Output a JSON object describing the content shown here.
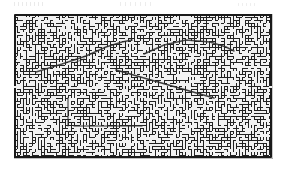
{
  "document": {
    "kind": "scanned-maze-puzzle",
    "page_background": "#ffffff",
    "title": ""
  },
  "figure": {
    "name": "maze",
    "caption": "",
    "x": 14,
    "y": 14,
    "width": 258,
    "height": 144,
    "border_color": "#1a1a1a",
    "border_width": 2,
    "wall_color": "#222222",
    "passage_color": "#f2f2f2",
    "path_color": "#2b2b2b"
  },
  "maze": {
    "columns": 86,
    "rows": 48,
    "cell_size": 3,
    "wall_thickness": 1,
    "seed": 20240517,
    "density": 0.52,
    "entrance": {
      "col": 0,
      "row": 24,
      "label": "start"
    },
    "exit": {
      "col": 85,
      "row": 24,
      "label": "finish"
    }
  },
  "annotations": {
    "label": "drawn solution strokes",
    "strokes": [
      {
        "name": "upper-left-ascending-stroke",
        "points": [
          [
            22,
            58
          ],
          [
            48,
            50
          ],
          [
            72,
            42
          ],
          [
            92,
            33
          ],
          [
            108,
            28
          ],
          [
            118,
            26
          ]
        ],
        "width": 1.6,
        "opacity": 0.85
      },
      {
        "name": "upper-right-arc-stroke",
        "points": [
          [
            130,
            40
          ],
          [
            150,
            31
          ],
          [
            172,
            26
          ],
          [
            196,
            28
          ],
          [
            212,
            33
          ],
          [
            220,
            37
          ]
        ],
        "width": 1.6,
        "opacity": 0.85
      },
      {
        "name": "center-descending-diagonal-stroke",
        "points": [
          [
            102,
            56
          ],
          [
            130,
            64
          ],
          [
            158,
            72
          ],
          [
            186,
            80
          ],
          [
            200,
            84
          ]
        ],
        "width": 1.7,
        "opacity": 0.9
      },
      {
        "name": "lower-left-vertical-stroke",
        "points": [
          [
            54,
            84
          ],
          [
            54,
            100
          ],
          [
            54,
            112
          ]
        ],
        "width": 1.4,
        "opacity": 0.7
      },
      {
        "name": "lower-center-horizontal-stroke",
        "points": [
          [
            60,
            112
          ],
          [
            96,
            112
          ],
          [
            128,
            112
          ]
        ],
        "width": 1.4,
        "opacity": 0.65
      },
      {
        "name": "upper-left-short-tick",
        "points": [
          [
            62,
            48
          ],
          [
            70,
            45
          ]
        ],
        "width": 1.3,
        "opacity": 0.6
      }
    ]
  },
  "scan_artifacts": {
    "top_speckle_bands": 3,
    "bottom_edge_shadow": true,
    "right_edge_shadow": true
  }
}
